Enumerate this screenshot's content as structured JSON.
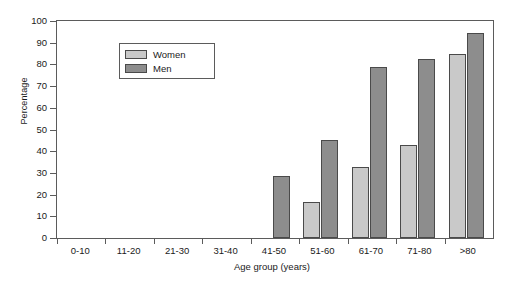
{
  "chart_data": {
    "type": "bar",
    "title": "",
    "xlabel": "Age group (years)",
    "ylabel": "Percentage",
    "categories": [
      "0-10",
      "11-20",
      "21-30",
      "31-40",
      "41-50",
      "51-60",
      "61-70",
      "71-80",
      ">80"
    ],
    "series": [
      {
        "name": "Women",
        "color": "#c9c9c9",
        "values": [
          0,
          0,
          0,
          0,
          0,
          16.5,
          32.5,
          43,
          85
        ]
      },
      {
        "name": "Men",
        "color": "#8d8d8d",
        "values": [
          0,
          0,
          0,
          0,
          28.5,
          45,
          79,
          82.5,
          94.5
        ]
      }
    ],
    "ylim": [
      0,
      100
    ],
    "yticks": [
      0,
      10,
      20,
      30,
      40,
      50,
      60,
      70,
      80,
      90,
      100
    ],
    "grid": false,
    "legend_position": "top-left"
  }
}
